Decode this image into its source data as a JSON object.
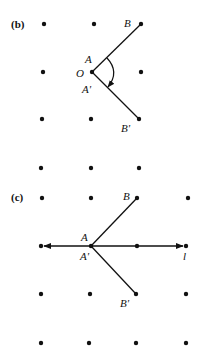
{
  "panels": [
    {
      "id": "b",
      "label": "(b)",
      "lattice": [
        [
          44,
          24
        ],
        [
          94,
          24
        ],
        [
          141,
          24
        ],
        [
          43,
          72
        ],
        [
          92,
          72
        ],
        [
          141,
          72
        ],
        [
          42,
          119
        ],
        [
          91,
          119
        ],
        [
          139,
          119
        ],
        [
          41,
          168
        ],
        [
          91,
          168
        ],
        [
          139,
          168
        ]
      ],
      "points": {
        "O": {
          "label": "O",
          "x": 92,
          "y": 72
        },
        "B": {
          "label": "B",
          "x": 141,
          "y": 24
        },
        "B_prime": {
          "label": "B'",
          "x": 139,
          "y": 119
        },
        "A": {
          "label": "A"
        },
        "A_prime": {
          "label": "A'"
        }
      },
      "annotation": "rotation arc from A to A' (clockwise)"
    },
    {
      "id": "c",
      "label": "(c)",
      "lattice": [
        [
          42,
          198
        ],
        [
          91,
          198
        ],
        [
          137,
          198
        ],
        [
          188,
          198
        ],
        [
          41,
          246
        ],
        [
          91,
          246
        ],
        [
          137,
          246
        ],
        [
          186,
          246
        ],
        [
          41,
          294
        ],
        [
          90,
          294
        ],
        [
          136,
          294
        ],
        [
          186,
          294
        ],
        [
          41,
          343
        ],
        [
          89,
          343
        ],
        [
          136,
          343
        ],
        [
          186,
          343
        ]
      ],
      "points": {
        "A": {
          "label": "A"
        },
        "A_prime": {
          "label": "A'"
        },
        "B": {
          "label": "B",
          "x": 137,
          "y": 198
        },
        "B_prime": {
          "label": "B'",
          "x": 136,
          "y": 294
        },
        "l": {
          "label": "l"
        }
      },
      "annotation": "line l through A with arrows both directions"
    }
  ],
  "colors": {
    "ink": "#111111",
    "background": "#ffffff"
  }
}
